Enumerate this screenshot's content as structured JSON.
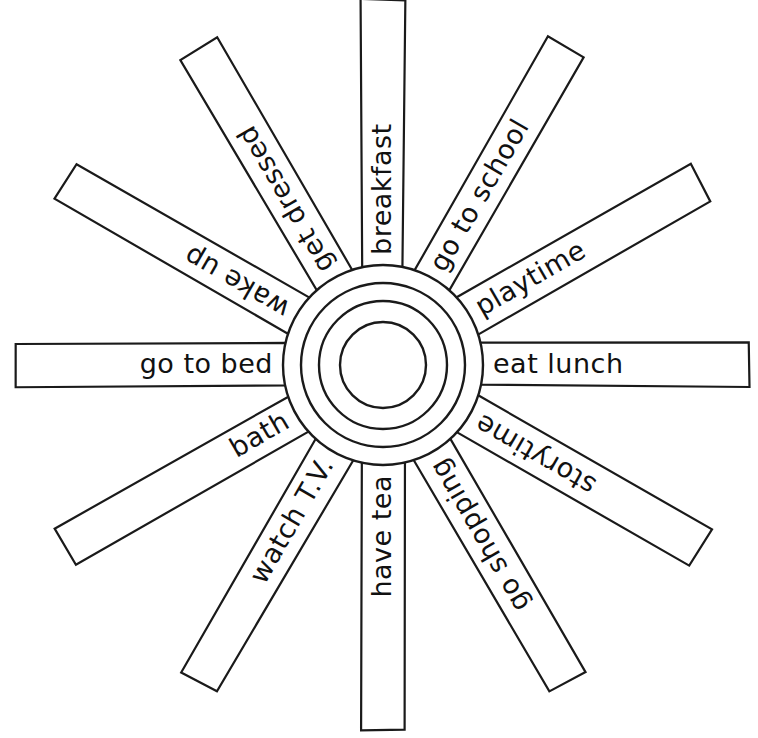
{
  "diagram": {
    "type": "radial-spoke-wheel",
    "center": {
      "x": 383,
      "y": 365
    },
    "spoke_count": 12,
    "spoke_width": 42,
    "spoke_inner_radius": 96,
    "spoke_outer_radius": 366,
    "angle_step_degrees": 30,
    "colors": {
      "background": "#ffffff",
      "stroke": "#1a1a1a",
      "text": "#111111",
      "fill": "#ffffff"
    },
    "hub": {
      "circle_count": 4,
      "radii": [
        100,
        82,
        64,
        43
      ]
    },
    "spokes": [
      {
        "label": "breakfast",
        "angle": -90,
        "flip": false,
        "align": "inner",
        "font_size": 27
      },
      {
        "label": "go to school",
        "angle": -60,
        "flip": false,
        "align": "inner",
        "font_size": 27
      },
      {
        "label": "playtime",
        "angle": -30,
        "flip": false,
        "align": "inner",
        "font_size": 27
      },
      {
        "label": "eat lunch",
        "angle": 0,
        "flip": false,
        "align": "inner",
        "font_size": 29
      },
      {
        "label": "storytime",
        "angle": 30,
        "flip": true,
        "align": "inner",
        "font_size": 27
      },
      {
        "label": "go shopping",
        "angle": 60,
        "flip": true,
        "align": "inner",
        "font_size": 27
      },
      {
        "label": "have tea",
        "angle": 90,
        "flip": true,
        "align": "inner",
        "font_size": 27
      },
      {
        "label": "watch T.V.",
        "angle": 120,
        "flip": true,
        "align": "inner",
        "font_size": 27
      },
      {
        "label": "bath",
        "angle": 150,
        "flip": true,
        "align": "inner",
        "font_size": 29
      },
      {
        "label": "go to bed",
        "angle": 180,
        "flip": true,
        "align": "inner",
        "font_size": 29
      },
      {
        "label": "wake up",
        "angle": 210,
        "flip": false,
        "align": "inner",
        "font_size": 27
      },
      {
        "label": "get dressed",
        "angle": 240,
        "flip": false,
        "align": "inner",
        "font_size": 27
      }
    ]
  }
}
